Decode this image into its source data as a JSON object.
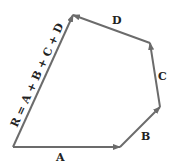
{
  "diagram": {
    "type": "vector-polygon-addition",
    "vectors": [
      {
        "label": "A",
        "from": [
          13,
          147
        ],
        "to": [
          120,
          147
        ]
      },
      {
        "label": "B",
        "from": [
          120,
          147
        ],
        "to": [
          160,
          107
        ]
      },
      {
        "label": "C",
        "from": [
          160,
          107
        ],
        "to": [
          150,
          43
        ]
      },
      {
        "label": "D",
        "from": [
          150,
          43
        ],
        "to": [
          73,
          15
        ]
      }
    ],
    "resultant": {
      "label": "R = A + B + C + D",
      "from": [
        13,
        147
      ],
      "to": [
        73,
        15
      ]
    },
    "colors": {
      "arrow": "#6b6b6b",
      "text": "#222222"
    }
  },
  "labels": {
    "a": "A",
    "b": "B",
    "c": "C",
    "d": "D",
    "r": "R = A + B + C + D"
  }
}
